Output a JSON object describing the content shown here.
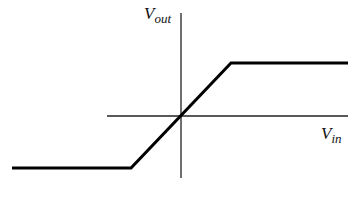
{
  "diagram": {
    "type": "transfer-characteristic",
    "y_axis_label": {
      "main": "V",
      "sub": "out"
    },
    "x_axis_label": {
      "main": "V",
      "sub": "in"
    },
    "curve": {
      "description": "piecewise linear: negative saturation, linear region through origin, positive saturation",
      "points": [
        [
          12,
          168
        ],
        [
          131,
          168
        ],
        [
          231,
          63
        ],
        [
          348,
          63
        ]
      ]
    },
    "colors": {
      "line": "#000000",
      "axis": "#222222",
      "background": "#ffffff"
    }
  }
}
